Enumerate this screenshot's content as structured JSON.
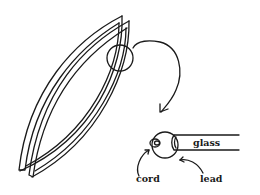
{
  "diagram": {
    "labels": {
      "glass": "glass",
      "cord": "cord",
      "lead": "lead"
    },
    "colors": {
      "ink": "#1a1a1a",
      "background": "#ffffff"
    }
  }
}
